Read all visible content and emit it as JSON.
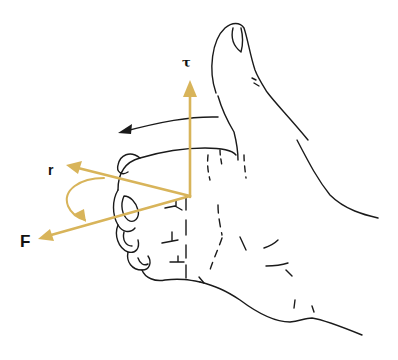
{
  "diagram": {
    "labels": {
      "tau": "τ",
      "r": "r",
      "F": "F"
    },
    "colors": {
      "vector": "#d8b45a",
      "outline": "#1a1a1a",
      "background": "#ffffff"
    },
    "vectors": [
      {
        "name": "tau",
        "label": "τ",
        "direction": "up (thumb)"
      },
      {
        "name": "r",
        "label": "r",
        "direction": "left-up"
      },
      {
        "name": "F",
        "label": "F",
        "direction": "left-down"
      }
    ]
  }
}
